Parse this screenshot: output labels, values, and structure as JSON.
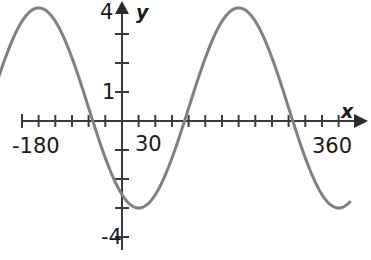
{
  "figure": {
    "title": "",
    "background_color": "#ffffff",
    "width": 371,
    "height": 260
  },
  "axes": {
    "x_axis_name": "x",
    "y_axis_name": "y",
    "x_axis_color": "#3a3a3a",
    "y_axis_color": "#3a3a3a",
    "x_labels": {
      "left": "-180",
      "middle": "30",
      "right": "360"
    },
    "y_labels": {
      "top": "4",
      "one": "1",
      "bottom": "-4"
    }
  },
  "curve": {
    "color": "#808080",
    "stroke_width": 3
  },
  "chart_data": {
    "type": "line",
    "title": "",
    "xlabel": "x",
    "ylabel": "y",
    "xlim": [
      -230,
      410
    ],
    "ylim": [
      -4,
      4
    ],
    "grid": false,
    "legend": null,
    "x_tick_labels": [
      "-180",
      "30",
      "360"
    ],
    "y_tick_labels": [
      "4",
      "1",
      "-4"
    ],
    "x_tick_interval": 30,
    "y_tick_interval": 1,
    "x_ticks": [
      -180,
      -150,
      -120,
      -90,
      -60,
      -30,
      0,
      30,
      60,
      90,
      120,
      150,
      180,
      210,
      240,
      270,
      300,
      330,
      360
    ],
    "y_ticks": [
      -4,
      -3,
      -2,
      -1,
      0,
      1,
      2,
      3,
      4
    ],
    "series": [
      {
        "name": "y = 3.45 cos(x + 30) - 0.45",
        "description": "cosine wave, amplitude about 3.45, period 360 degrees, minimum near x = 30 at y = -3, maximum near x = 210 at y = 3.9",
        "x": [
          -230,
          -210,
          -180,
          -150,
          -120,
          -90,
          -60,
          -30,
          0,
          30,
          60,
          90,
          120,
          150,
          180,
          210,
          240,
          270,
          300,
          330,
          360,
          390,
          410
        ],
        "y": [
          3.9,
          3.6,
          2.55,
          1.05,
          -0.6,
          -2.1,
          -3.15,
          -3.6,
          -3.3,
          -3.0,
          -2.4,
          -1.2,
          0.45,
          2.1,
          3.3,
          3.9,
          3.75,
          2.85,
          1.5,
          -0.3,
          -1.95,
          -3.0,
          -3.3
        ],
        "zero_crossings": [
          -127,
          107,
          318
        ],
        "minimum": {
          "x": 30,
          "y": -3.0
        },
        "maximum": {
          "x": 210,
          "y": 3.9
        }
      }
    ]
  }
}
